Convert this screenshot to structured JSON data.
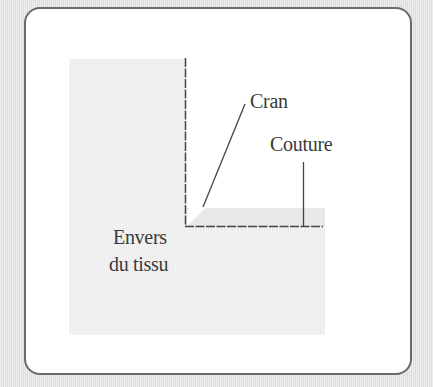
{
  "diagram": {
    "labels": {
      "cran": "Cran",
      "couture": "Couture",
      "envers_line1": "Envers",
      "envers_line2": "du tissu"
    },
    "colors": {
      "background": "#e4e4e4",
      "frame_border": "#6a6a6a",
      "panel": "#ffffff",
      "fabric": "#f2f2f2",
      "seam_allowance": "#e9e9e9",
      "line": "#444444",
      "text": "#3a3a3a"
    }
  }
}
